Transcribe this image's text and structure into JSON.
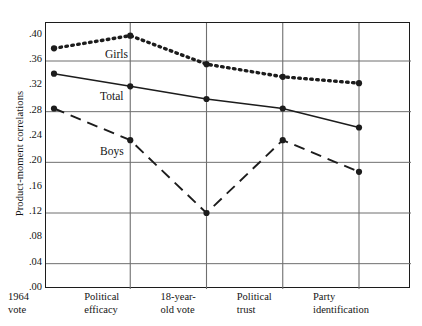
{
  "chart_data": {
    "type": "line",
    "title": "",
    "xlabel": "",
    "ylabel": "Product-moment correlations",
    "categories": [
      "1964 vote",
      "Political efficacy",
      "18-year-old vote",
      "Political trust",
      "Party identification"
    ],
    "category_lines": [
      [
        "1964",
        "vote"
      ],
      [
        "Political",
        "efficacy"
      ],
      [
        "18-year-",
        "old vote"
      ],
      [
        "Political",
        "trust"
      ],
      [
        "Party",
        "identification"
      ]
    ],
    "series": [
      {
        "name": "Girls",
        "style": "dotted",
        "values": [
          0.38,
          0.4,
          0.355,
          0.335,
          0.325
        ]
      },
      {
        "name": "Total",
        "style": "solid",
        "values": [
          0.34,
          0.32,
          0.3,
          0.285,
          0.255
        ]
      },
      {
        "name": "Boys",
        "style": "dashed",
        "values": [
          0.285,
          0.235,
          0.12,
          0.235,
          0.185
        ]
      }
    ],
    "ylim": [
      0.0,
      0.42
    ],
    "yticks": [
      0.0,
      0.04,
      0.08,
      0.12,
      0.16,
      0.2,
      0.24,
      0.28,
      0.32,
      0.36,
      0.4
    ],
    "ytick_labels": [
      ".00",
      ".04",
      ".08",
      ".12",
      ".16",
      ".20",
      ".24",
      ".28",
      ".32",
      ".36",
      ".40"
    ],
    "gridlines_y": [
      0.04,
      0.12,
      0.2,
      0.28,
      0.36
    ],
    "grid": true,
    "legend": "inline-labels",
    "series_label_positions": [
      {
        "name": "Girls",
        "x": 105,
        "y": 48
      },
      {
        "name": "Total",
        "x": 100,
        "y": 90
      },
      {
        "name": "Boys",
        "x": 100,
        "y": 145
      }
    ],
    "colors": {
      "line": "#1c1c1c",
      "grid": "#6f6f6f",
      "frame": "#1c1c1c",
      "text": "#141414",
      "background": "#ffffff"
    }
  }
}
